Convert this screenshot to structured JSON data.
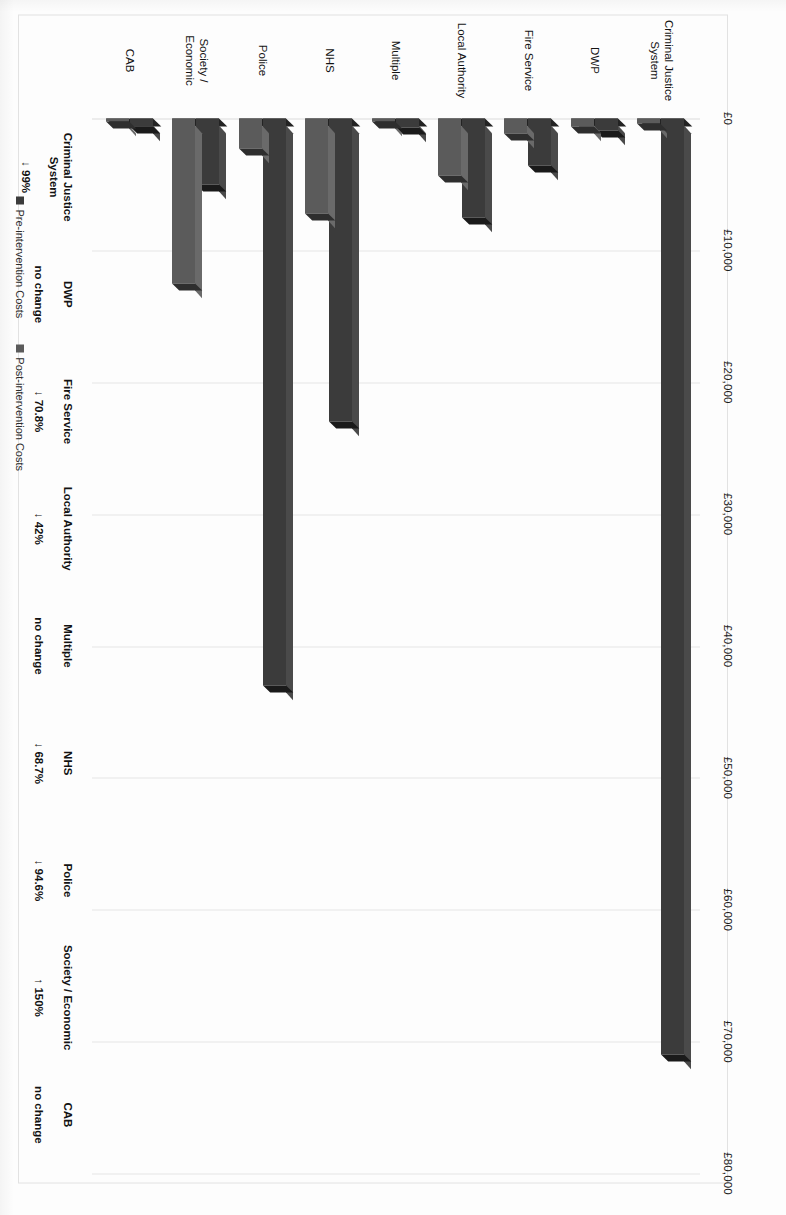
{
  "chart_data": {
    "type": "bar",
    "orientation": "horizontal",
    "title": "",
    "xlabel": "",
    "ylabel": "",
    "categories": [
      "Criminal Justice System",
      "DWP",
      "Fire Service",
      "Local Authority",
      "Multiple",
      "NHS",
      "Police",
      "Society / Economic",
      "CAB"
    ],
    "series": [
      {
        "name": "Pre-intervention Costs",
        "color": "#3b3b3b",
        "values": [
          71000,
          900,
          3600,
          7500,
          700,
          23000,
          43000,
          5000,
          600
        ]
      },
      {
        "name": "Post-intervention Costs",
        "color": "#5b5b5b",
        "values": [
          400,
          600,
          1100,
          4300,
          0,
          7200,
          2300,
          12500,
          0
        ]
      }
    ],
    "xlim": [
      0,
      80000
    ],
    "xticks": [
      0,
      10000,
      20000,
      30000,
      40000,
      50000,
      60000,
      70000,
      80000
    ],
    "xtick_labels": [
      "£0",
      "£10,000",
      "£20,000",
      "£30,000",
      "£40,000",
      "£50,000",
      "£60,000",
      "£70,000",
      "£80,000"
    ],
    "grid": true,
    "legend_position": "bottom-left",
    "annotations": [
      {
        "name": "Criminal Justice System",
        "change": "↓ 99%"
      },
      {
        "name": "DWP",
        "change": "no change"
      },
      {
        "name": "Fire Service",
        "change": "↓ 70.8%"
      },
      {
        "name": "Local Authority",
        "change": "↓ 42%"
      },
      {
        "name": "Multiple",
        "change": "no change"
      },
      {
        "name": "NHS",
        "change": "↓ 68.7%"
      },
      {
        "name": "Police",
        "change": "↓ 94.6%"
      },
      {
        "name": "Society / Economic",
        "change": "↑ 150%"
      },
      {
        "name": "CAB",
        "change": "no change"
      }
    ]
  },
  "legend": {
    "items": [
      {
        "label": "Pre-intervention Costs",
        "color": "#3b3b3b"
      },
      {
        "label": "Post-intervention Costs",
        "color": "#5b5b5b"
      }
    ]
  }
}
